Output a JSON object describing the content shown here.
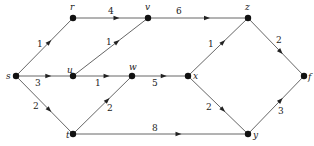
{
  "diagram": {
    "type": "weighted directed graph",
    "nodes": [
      {
        "id": "s",
        "label": "s",
        "x": 16,
        "y": 76,
        "lx": 6,
        "ly": 79
      },
      {
        "id": "r",
        "label": "r",
        "x": 73,
        "y": 18,
        "lx": 70,
        "ly": 10
      },
      {
        "id": "v",
        "label": "v",
        "x": 148,
        "y": 18,
        "lx": 145,
        "ly": 10
      },
      {
        "id": "z",
        "label": "z",
        "x": 248,
        "y": 18,
        "lx": 245,
        "ly": 10
      },
      {
        "id": "u",
        "label": "u",
        "x": 73,
        "y": 76,
        "lx": 67,
        "ly": 73
      },
      {
        "id": "w",
        "label": "w",
        "x": 132,
        "y": 76,
        "lx": 129,
        "ly": 70
      },
      {
        "id": "x",
        "label": "x",
        "x": 188,
        "y": 76,
        "lx": 193,
        "ly": 79
      },
      {
        "id": "f",
        "label": "f",
        "x": 304,
        "y": 76,
        "lx": 308,
        "ly": 80
      },
      {
        "id": "t",
        "label": "t",
        "x": 73,
        "y": 134,
        "lx": 66,
        "ly": 138
      },
      {
        "id": "y",
        "label": "y",
        "x": 248,
        "y": 134,
        "lx": 253,
        "ly": 138
      }
    ],
    "edges": [
      {
        "from": "s",
        "to": "r",
        "weight": "1",
        "lx": 37,
        "ly": 47
      },
      {
        "from": "s",
        "to": "u",
        "weight": "3",
        "lx": 35,
        "ly": 86
      },
      {
        "from": "s",
        "to": "t",
        "weight": "2",
        "lx": 33,
        "ly": 109
      },
      {
        "from": "r",
        "to": "v",
        "weight": "4",
        "lx": 108,
        "ly": 14
      },
      {
        "from": "u",
        "to": "v",
        "weight": "1",
        "lx": 106,
        "ly": 45
      },
      {
        "from": "u",
        "to": "w",
        "weight": "1",
        "lx": 95,
        "ly": 86
      },
      {
        "from": "t",
        "to": "w",
        "weight": "2",
        "lx": 107,
        "ly": 111
      },
      {
        "from": "v",
        "to": "z",
        "weight": "6",
        "lx": 176,
        "ly": 14
      },
      {
        "from": "w",
        "to": "x",
        "weight": "5",
        "lx": 152,
        "ly": 86
      },
      {
        "from": "x",
        "to": "z",
        "weight": "1",
        "lx": 208,
        "ly": 47
      },
      {
        "from": "x",
        "to": "y",
        "weight": "2",
        "lx": 206,
        "ly": 110
      },
      {
        "from": "t",
        "to": "y",
        "weight": "8",
        "lx": 152,
        "ly": 131
      },
      {
        "from": "z",
        "to": "f",
        "weight": "2",
        "lx": 276,
        "ly": 43
      },
      {
        "from": "y",
        "to": "f",
        "weight": "3",
        "lx": 278,
        "ly": 114
      }
    ]
  }
}
